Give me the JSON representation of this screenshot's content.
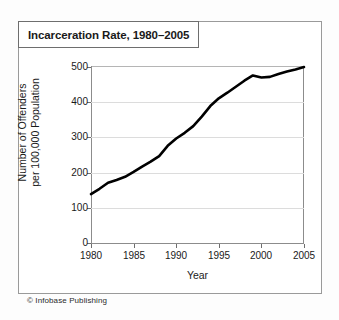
{
  "figure": {
    "title": "Incarceration Rate, 1980–2005",
    "credit": "© Infobase Publishing",
    "line_color": "#000000",
    "grid_color": "#dcdcdc",
    "axis_color": "#8c8c8c"
  },
  "chart_data": {
    "type": "line",
    "title": "Incarceration Rate, 1980–2005",
    "xlabel": "Year",
    "ylabel": "Number of Offenders per 100,000 Population",
    "ylabel_lines": [
      "Number of Offenders",
      "per 100,000 Population"
    ],
    "xlim": [
      1980,
      2005
    ],
    "ylim": [
      0,
      500
    ],
    "yticks": [
      0,
      100,
      200,
      300,
      400,
      500
    ],
    "xticks": [
      1980,
      1985,
      1990,
      1995,
      2000,
      2005
    ],
    "ytick_labels": [
      "0",
      "100",
      "200",
      "300",
      "400",
      "500"
    ],
    "xtick_labels": [
      "1980",
      "1985",
      "1990",
      "1995",
      "2000",
      "2005"
    ],
    "grid": "horizontal",
    "legend": "none",
    "x": [
      1980,
      1981,
      1982,
      1983,
      1984,
      1985,
      1986,
      1987,
      1988,
      1989,
      1990,
      1991,
      1992,
      1993,
      1994,
      1995,
      1996,
      1997,
      1998,
      1999,
      2000,
      2001,
      2002,
      2003,
      2004,
      2005
    ],
    "values": [
      139,
      154,
      171,
      179,
      188,
      202,
      217,
      231,
      247,
      276,
      297,
      313,
      332,
      359,
      389,
      411,
      427,
      444,
      461,
      476,
      470,
      472,
      480,
      487,
      493,
      500
    ],
    "series": [
      {
        "name": "Incarceration rate per 100,000 population",
        "values": [
          139,
          154,
          171,
          179,
          188,
          202,
          217,
          231,
          247,
          276,
          297,
          313,
          332,
          359,
          389,
          411,
          427,
          444,
          461,
          476,
          470,
          472,
          480,
          487,
          493,
          500
        ]
      }
    ]
  }
}
